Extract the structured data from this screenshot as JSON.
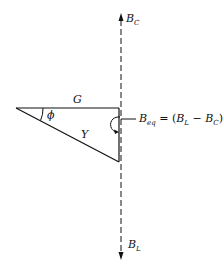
{
  "diagram": {
    "type": "admittance-triangle",
    "labels": {
      "top_arrow": "B",
      "top_arrow_sub": "C",
      "bottom_arrow": "B",
      "bottom_arrow_sub": "L",
      "horizontal_side": "G",
      "hypotenuse": "Y",
      "angle": "ϕ",
      "equation_lhs": "B",
      "equation_lhs_sub": "eq",
      "equation_eq": " = (",
      "equation_bl": "B",
      "equation_bl_sub": "L",
      "equation_minus": " − ",
      "equation_bc": "B",
      "equation_bc_sub": "C",
      "equation_close": ")"
    },
    "colors": {
      "line": "#111111",
      "background": "#ffffff"
    }
  }
}
